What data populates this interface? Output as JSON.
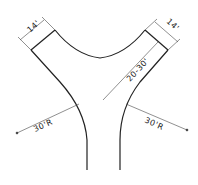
{
  "diagram": {
    "type": "road-junction-plan",
    "dimensions": {
      "left_branch_width": "14'",
      "right_branch_width": "14'",
      "right_branch_length": "20-30'",
      "left_radius": "30'R",
      "right_radius": "30'R"
    },
    "colors": {
      "line": "#222222",
      "background": "#ffffff"
    }
  }
}
